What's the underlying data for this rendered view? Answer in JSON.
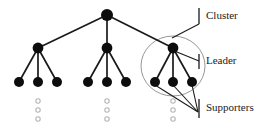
{
  "diagram": {
    "type": "tree",
    "colors": {
      "node_fill": "#0d0d0d",
      "edge": "#1a1a1a",
      "cluster_circle": "#8a8a8a",
      "ellipsis_dot": "#b5b5b5",
      "text": "#1a1a1a",
      "background": "#ffffff"
    },
    "labels": [
      {
        "id": "cluster",
        "text": "Cluster",
        "x": 206,
        "y": 16
      },
      {
        "id": "leader",
        "text": "Leader",
        "x": 206,
        "y": 61
      },
      {
        "id": "supporters",
        "text": "Supporters",
        "x": 206,
        "y": 108
      }
    ],
    "nodes": [
      {
        "id": "root",
        "level": 0,
        "role": "root",
        "cx": 107,
        "cy": 15,
        "r": 6.0
      },
      {
        "id": "l1-a",
        "level": 1,
        "role": "leader",
        "cx": 38,
        "cy": 48,
        "r": 5.4
      },
      {
        "id": "l1-b",
        "level": 1,
        "role": "leader",
        "cx": 107,
        "cy": 48,
        "r": 5.4
      },
      {
        "id": "l1-c",
        "level": 1,
        "role": "leader",
        "cx": 173,
        "cy": 48,
        "r": 5.4
      },
      {
        "id": "l2-a1",
        "level": 2,
        "role": "supporter",
        "cx": 19,
        "cy": 82,
        "r": 5.0
      },
      {
        "id": "l2-a2",
        "level": 2,
        "role": "supporter",
        "cx": 38,
        "cy": 82,
        "r": 5.0
      },
      {
        "id": "l2-a3",
        "level": 2,
        "role": "supporter",
        "cx": 57,
        "cy": 82,
        "r": 5.0
      },
      {
        "id": "l2-b1",
        "level": 2,
        "role": "supporter",
        "cx": 88,
        "cy": 82,
        "r": 5.0
      },
      {
        "id": "l2-b2",
        "level": 2,
        "role": "supporter",
        "cx": 107,
        "cy": 82,
        "r": 5.0
      },
      {
        "id": "l2-b3",
        "level": 2,
        "role": "supporter",
        "cx": 126,
        "cy": 82,
        "r": 5.0
      },
      {
        "id": "l2-c1",
        "level": 2,
        "role": "supporter",
        "cx": 155,
        "cy": 82,
        "r": 5.0
      },
      {
        "id": "l2-c2",
        "level": 2,
        "role": "supporter",
        "cx": 173,
        "cy": 82,
        "r": 5.0
      },
      {
        "id": "l2-c3",
        "level": 2,
        "role": "supporter",
        "cx": 192,
        "cy": 82,
        "r": 5.0
      }
    ],
    "edges": [
      {
        "from": "root",
        "to": "l1-a"
      },
      {
        "from": "root",
        "to": "l1-b"
      },
      {
        "from": "root",
        "to": "l1-c"
      },
      {
        "from": "l1-a",
        "to": "l2-a1"
      },
      {
        "from": "l1-a",
        "to": "l2-a2"
      },
      {
        "from": "l1-a",
        "to": "l2-a3"
      },
      {
        "from": "l1-b",
        "to": "l2-b1"
      },
      {
        "from": "l1-b",
        "to": "l2-b2"
      },
      {
        "from": "l1-b",
        "to": "l2-b3"
      },
      {
        "from": "l1-c",
        "to": "l2-c1"
      },
      {
        "from": "l1-c",
        "to": "l2-c2"
      },
      {
        "from": "l1-c",
        "to": "l2-c3"
      }
    ],
    "cluster_highlight": {
      "cx": 173,
      "cy": 66,
      "rx": 32,
      "ry": 30
    },
    "ellipsis_groups": [
      {
        "cx": 38,
        "ys": [
          101,
          110,
          119
        ],
        "r": 2.2
      },
      {
        "cx": 107,
        "ys": [
          101,
          110,
          119
        ],
        "r": 2.2
      },
      {
        "cx": 173,
        "ys": [
          101,
          110,
          119
        ],
        "r": 2.2
      }
    ],
    "callouts": [
      {
        "id": "cluster-callout",
        "tick_x": 199,
        "tick_y1": 8,
        "tick_y2": 24,
        "line": "M 199 24 L 172 38"
      },
      {
        "id": "leader-callout",
        "tick_x": 199,
        "tick_y1": 54,
        "tick_y2": 69,
        "line": "M 199 61 L 172 50"
      },
      {
        "id": "supporters-callout",
        "tick_x": 199,
        "tick_y1": 99,
        "tick_y2": 118,
        "lines": [
          "M 198 112 L 155 85",
          "M 198 112 L 173 85",
          "M 198 112 L 192 85"
        ]
      }
    ]
  }
}
